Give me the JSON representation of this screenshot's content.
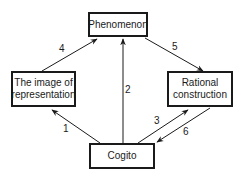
{
  "diagram": {
    "nodes": {
      "phenomenon": {
        "label": "Phenomenon"
      },
      "image": {
        "label": "The image of representation"
      },
      "rational": {
        "label": "Rational construction"
      },
      "cogito": {
        "label": "Cogito"
      }
    },
    "edges": [
      {
        "id": "1",
        "label": "1",
        "from": "Cogito",
        "to": "The image of representation"
      },
      {
        "id": "2",
        "label": "2",
        "from": "Cogito",
        "to": "Phenomenon"
      },
      {
        "id": "3",
        "label": "3",
        "from": "Cogito",
        "to": "Rational construction"
      },
      {
        "id": "4",
        "label": "4",
        "from": "The image of representation",
        "to": "Phenomenon"
      },
      {
        "id": "5",
        "label": "5",
        "from": "Phenomenon",
        "to": "Rational construction"
      },
      {
        "id": "6",
        "label": "6",
        "from": "Rational construction",
        "to": "Cogito"
      }
    ]
  }
}
